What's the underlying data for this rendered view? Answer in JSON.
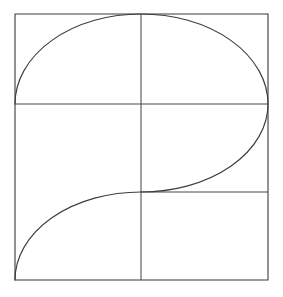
{
  "figure": {
    "background_color": "#ffffff",
    "line_color": "#3d3d3d",
    "stroke_width": 1.1,
    "canvas": {
      "width": 283,
      "height": 297
    },
    "square": {
      "name": "outer-square",
      "left": 15,
      "top": 14,
      "right": 268,
      "bottom": 280,
      "width": 253,
      "height": 266,
      "path": "M 15 14 L 268 14 L 268 280 L 15 280 Z"
    },
    "dividers": [
      {
        "name": "vertical-divider",
        "orientation": "vertical",
        "x": 141,
        "y_start": 14,
        "y_end": 280,
        "path": "M 141 14 L 141 280"
      },
      {
        "name": "horizontal-midline",
        "orientation": "horizontal",
        "y": 104,
        "x_start": 15,
        "x_end": 268,
        "path": "M 15 104 L 268 104"
      },
      {
        "name": "horizontal-lower-right-line",
        "orientation": "horizontal",
        "y": 192,
        "x_start": 141,
        "x_end": 268,
        "path": "M 141 192 L 268 192"
      }
    ],
    "curve": {
      "name": "s-curve",
      "description": "Continuous S-shaped curve composed of three elliptical arcs",
      "path": "M 15 104 A 126 90 0 0 1 141 14 A 127 90 0 0 1 268 104 A 127 88 0 0 1 141 192 A 126 88 0 0 0 15 280",
      "segments": [
        {
          "name": "upper-left-arc",
          "from": [
            15,
            104
          ],
          "to": [
            141,
            14
          ],
          "rx": 126,
          "ry": 90,
          "sweep": "clockwise"
        },
        {
          "name": "upper-right-arc",
          "from": [
            141,
            14
          ],
          "to": [
            268,
            104
          ],
          "rx": 127,
          "ry": 90,
          "sweep": "clockwise"
        },
        {
          "name": "middle-right-arc",
          "from": [
            268,
            104
          ],
          "to": [
            141,
            192
          ],
          "rx": 127,
          "ry": 88,
          "sweep": "clockwise"
        },
        {
          "name": "lower-left-arc",
          "from": [
            141,
            192
          ],
          "to": [
            15,
            280
          ],
          "rx": 126,
          "ry": 88,
          "sweep": "counter-clockwise"
        }
      ]
    }
  }
}
